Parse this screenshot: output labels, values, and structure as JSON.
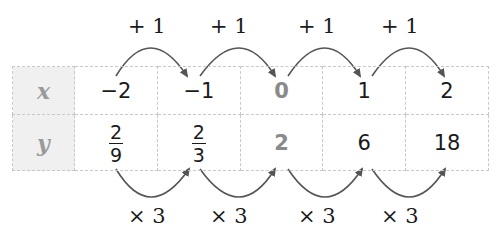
{
  "table": {
    "rows": [
      {
        "header": "x",
        "values": [
          "−2",
          "−1",
          "0",
          "1",
          "2"
        ]
      },
      {
        "header": "y",
        "values": [
          {
            "num": "2",
            "den": "9"
          },
          {
            "num": "2",
            "den": "3"
          },
          "2",
          "6",
          "18"
        ]
      }
    ],
    "highlight_column": 2
  },
  "annotations": {
    "top": [
      "+ 1",
      "+ 1",
      "+ 1",
      "+ 1"
    ],
    "bottom": [
      "× 3",
      "× 3",
      "× 3",
      "× 3"
    ]
  },
  "colors": {
    "header_bg": "#f0f0f0",
    "header_text": "#9a9a9a",
    "highlight_text": "#8a8a8a",
    "arrow": "#555555"
  }
}
